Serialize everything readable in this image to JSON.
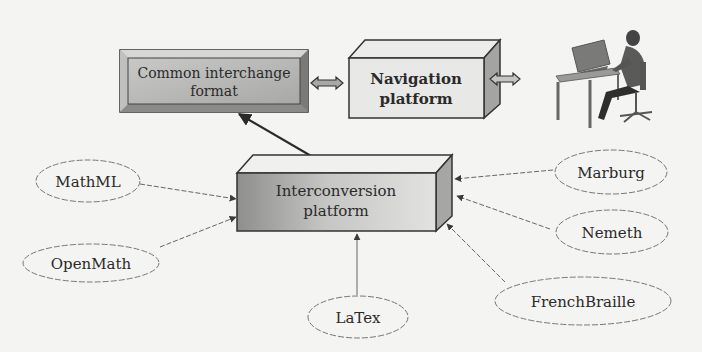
{
  "diagram": {
    "boxes": {
      "common_interchange": {
        "line1": "Common interchange",
        "line2": "format"
      },
      "navigation": {
        "line1": "Navigation",
        "line2": "platform"
      },
      "interconversion": {
        "line1": "Interconversion",
        "line2": "platform"
      }
    },
    "formats": {
      "mathml": "MathML",
      "openmath": "OpenMath",
      "latex": "LaTex",
      "marburg": "Marburg",
      "nemeth": "Nemeth",
      "frenchbraille": "FrenchBraille"
    },
    "user": {
      "icon": "user-at-computer-icon"
    },
    "colors": {
      "background": "#f4f4f2",
      "box_fill": "#b8b8b6",
      "box_light": "#e6e6e4",
      "box_dark": "#888886",
      "stroke": "#333333",
      "arrow": "#555555"
    }
  }
}
